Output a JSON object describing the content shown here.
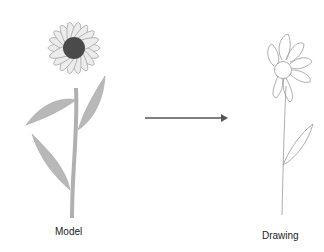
{
  "labels": {
    "model": "Model",
    "drawing": "Drawing"
  },
  "colors": {
    "petal_fill": "#e8e8e8",
    "petal_stroke": "#a8a8a8",
    "center_fill": "#4a4a4a",
    "leaf_fill": "#b8b8b8",
    "arrow": "#555555",
    "sketch_stroke": "#9a9a9a"
  },
  "icons": {
    "model_flower": "shaded-daisy-illustration",
    "arrow": "right-arrow",
    "drawing_flower": "line-sketch-daisy"
  }
}
